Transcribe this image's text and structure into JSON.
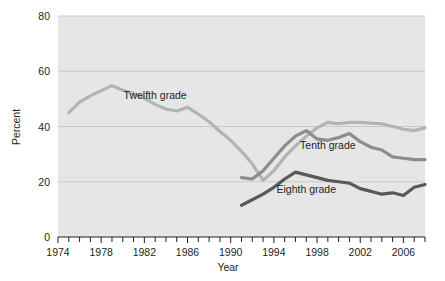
{
  "chart_data": {
    "type": "line",
    "title": "",
    "xlabel": "Year",
    "ylabel": "Percent",
    "xlim": [
      1974,
      2008
    ],
    "ylim": [
      0,
      80
    ],
    "yticks": [
      0,
      20,
      40,
      60,
      80
    ],
    "ytick_labels": [
      "0",
      "20",
      "40",
      "60",
      "80"
    ],
    "xticks": [
      1974,
      1975,
      1976,
      1977,
      1978,
      1979,
      1980,
      1981,
      1982,
      1983,
      1984,
      1985,
      1986,
      1987,
      1988,
      1989,
      1990,
      1991,
      1992,
      1993,
      1994,
      1995,
      1996,
      1997,
      1998,
      1999,
      2000,
      2001,
      2002,
      2003,
      2004,
      2005,
      2006,
      2007,
      2008
    ],
    "xtick_labels_shown": [
      "1974",
      "1978",
      "1982",
      "1986",
      "1990",
      "1994",
      "1998",
      "2002",
      "2006"
    ],
    "xtick_labels_values": [
      1974,
      1978,
      1982,
      1986,
      1990,
      1994,
      1998,
      2002,
      2006
    ],
    "grid": "horizontal",
    "legend_position": "inline-annotations",
    "plot_background": "#e6e6e6",
    "series": [
      {
        "name": "Twelfth grade",
        "color": "#b3b3b3",
        "label_x": 1983,
        "label_y": 50,
        "x": [
          1975,
          1976,
          1977,
          1978,
          1979,
          1980,
          1981,
          1982,
          1983,
          1984,
          1985,
          1986,
          1987,
          1988,
          1989,
          1990,
          1991,
          1992,
          1993,
          1994,
          1995,
          1996,
          1997,
          1998,
          1999,
          2000,
          2001,
          2002,
          2003,
          2004,
          2005,
          2006,
          2007,
          2008
        ],
        "values": [
          45.0,
          48.8,
          51.1,
          53.0,
          54.8,
          53.1,
          51.9,
          50.2,
          48.0,
          46.3,
          45.6,
          47.0,
          44.5,
          41.7,
          38.2,
          35.0,
          31.0,
          26.5,
          20.5,
          24.0,
          29.0,
          33.0,
          36.5,
          39.5,
          41.5,
          41.0,
          41.5,
          41.5,
          41.2,
          41.0,
          40.0,
          39.0,
          38.5,
          39.5
        ]
      },
      {
        "name": "Tenth grade",
        "color": "#8c8c8c",
        "label_x": 1999,
        "label_y": 32,
        "x": [
          1991,
          1992,
          1993,
          1994,
          1995,
          1996,
          1997,
          1998,
          1999,
          2000,
          2001,
          2002,
          2003,
          2004,
          2005,
          2006,
          2007,
          2008
        ],
        "values": [
          21.5,
          21.0,
          24.0,
          28.5,
          33.0,
          36.5,
          38.5,
          35.5,
          35.0,
          36.0,
          37.5,
          34.5,
          32.5,
          31.5,
          29.0,
          28.5,
          28.0,
          28.0
        ]
      },
      {
        "name": "Eighth grade",
        "color": "#595959",
        "label_x": 1997,
        "label_y": 16,
        "x": [
          1991,
          1992,
          1993,
          1994,
          1995,
          1996,
          1997,
          1998,
          1999,
          2000,
          2001,
          2002,
          2003,
          2004,
          2005,
          2006,
          2007,
          2008
        ],
        "values": [
          11.5,
          13.5,
          15.5,
          18.0,
          21.0,
          23.5,
          22.5,
          21.5,
          20.5,
          20.0,
          19.5,
          17.5,
          16.5,
          15.5,
          16.0,
          15.0,
          18.0,
          19.0
        ]
      }
    ]
  }
}
